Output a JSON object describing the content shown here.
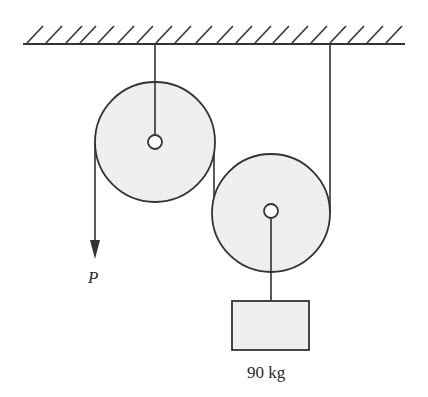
{
  "diagram": {
    "type": "pulley-system",
    "colors": {
      "stroke": "#333333",
      "fill": "#eeeeee",
      "background": "#ffffff"
    },
    "ceiling": {
      "label": "fixed support"
    },
    "pulleys": [
      {
        "name": "fixed pulley",
        "role": "attached to ceiling"
      },
      {
        "name": "movable pulley",
        "role": "carries load"
      }
    ],
    "force": {
      "label": "P",
      "direction": "down"
    },
    "load": {
      "mass_label": "90 kg"
    }
  }
}
